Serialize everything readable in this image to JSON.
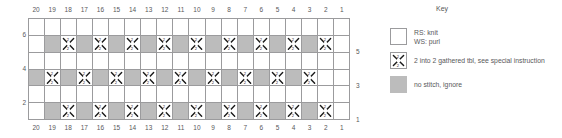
{
  "chart_data": {
    "type": "table",
    "title": "",
    "xlabel": "",
    "ylabel": "",
    "column_labels_top": [
      "20",
      "19",
      "18",
      "17",
      "16",
      "15",
      "14",
      "13",
      "12",
      "11",
      "10",
      "9",
      "8",
      "7",
      "6",
      "5",
      "4",
      "3",
      "2",
      "1"
    ],
    "column_labels_bottom": [
      "20",
      "19",
      "18",
      "17",
      "16",
      "15",
      "14",
      "13",
      "12",
      "11",
      "10",
      "9",
      "8",
      "7",
      "6",
      "5",
      "4",
      "3",
      "2",
      "1"
    ],
    "row_labels_left": [
      "6",
      "4",
      "2"
    ],
    "row_labels_right": [
      "5",
      "3",
      "1"
    ],
    "rows_top_to_bottom": [
      6,
      5,
      4,
      3,
      2,
      1
    ],
    "cell_codes": {
      "knit": "RS: knit / WS: purl (empty white square)",
      "gathered": "2 into 2 gathered tbl",
      "nostitch": "no stitch, ignore"
    },
    "grid": [
      [
        "knit",
        "knit",
        "knit",
        "knit",
        "knit",
        "knit",
        "knit",
        "knit",
        "knit",
        "knit",
        "knit",
        "knit",
        "knit",
        "knit",
        "knit",
        "knit",
        "knit",
        "knit",
        "knit",
        "knit"
      ],
      [
        "knit",
        "nostitch",
        "gathered",
        "nostitch",
        "gathered",
        "nostitch",
        "gathered",
        "nostitch",
        "gathered",
        "nostitch",
        "gathered",
        "nostitch",
        "gathered",
        "nostitch",
        "gathered",
        "nostitch",
        "gathered",
        "nostitch",
        "gathered",
        "knit"
      ],
      [
        "knit",
        "knit",
        "knit",
        "knit",
        "knit",
        "knit",
        "knit",
        "knit",
        "knit",
        "knit",
        "knit",
        "knit",
        "knit",
        "knit",
        "knit",
        "knit",
        "knit",
        "knit",
        "knit",
        "knit"
      ],
      [
        "nostitch",
        "gathered",
        "nostitch",
        "gathered",
        "nostitch",
        "gathered",
        "nostitch",
        "gathered",
        "nostitch",
        "gathered",
        "nostitch",
        "gathered",
        "nostitch",
        "gathered",
        "nostitch",
        "gathered",
        "nostitch",
        "gathered",
        "knit",
        "knit"
      ],
      [
        "knit",
        "knit",
        "knit",
        "knit",
        "knit",
        "knit",
        "knit",
        "knit",
        "knit",
        "knit",
        "knit",
        "knit",
        "knit",
        "knit",
        "knit",
        "knit",
        "knit",
        "knit",
        "knit",
        "knit"
      ],
      [
        "knit",
        "nostitch",
        "gathered",
        "nostitch",
        "gathered",
        "nostitch",
        "gathered",
        "nostitch",
        "gathered",
        "nostitch",
        "gathered",
        "nostitch",
        "gathered",
        "nostitch",
        "gathered",
        "nostitch",
        "gathered",
        "nostitch",
        "gathered",
        "knit"
      ]
    ],
    "colors": {
      "no_stitch_fill": "#bcbcbc",
      "knit_fill": "#ffffff",
      "grid_line": "#9b9b9d",
      "text": "#58585a",
      "symbol": "#1a1a1a"
    }
  },
  "key": {
    "title": "Key",
    "entries": [
      {
        "swatch": "white-square",
        "line1": "RS: knit",
        "line2": "WS: purl"
      },
      {
        "swatch": "gathered-symbol",
        "line1": "2 into 2 gathered tbl, see special instruction",
        "line2": ""
      },
      {
        "swatch": "gray-square",
        "line1": "no stitch, ignore",
        "line2": ""
      }
    ]
  },
  "symbol": {
    "top_digit": "2",
    "bottom_digit": "2"
  }
}
